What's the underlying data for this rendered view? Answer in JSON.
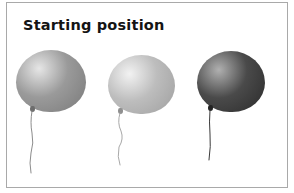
{
  "panel": {
    "title": "Starting position",
    "background_color": "#ffffff",
    "border_color": "#a9a9a9"
  },
  "scene": {
    "description": "Three balloons in a row shown at their starting position",
    "object_count": 3,
    "balloons": [
      {
        "name": "balloon-left",
        "shade_label": "medium gray",
        "fill_color": "#9a9a9a",
        "highlight_color": "#e6e6e6",
        "edge_color": "#7e7e7e",
        "knot_color": "#6d6d6d",
        "string_color": "#8c8c8c",
        "left": 16,
        "top": 50,
        "width": 70,
        "height": 62,
        "highlight_x_pct": 33,
        "highlight_y_pct": 30,
        "knot_x": 30,
        "knot_y": 106,
        "string_height": 62,
        "string_path": "M 3 0 Q 1 12 3 22 Q 5 32 2 42 Q 0 52 2 62"
      },
      {
        "name": "balloon-center",
        "shade_label": "light gray",
        "fill_color": "#bdbdbd",
        "highlight_color": "#f2f2f2",
        "edge_color": "#a3a3a3",
        "knot_color": "#8f8f8f",
        "string_color": "#a8a8a8",
        "left": 108,
        "top": 55,
        "width": 67,
        "height": 59,
        "highlight_x_pct": 32,
        "highlight_y_pct": 32,
        "knot_x": 118,
        "knot_y": 108,
        "string_height": 52,
        "string_path": "M 3 0 Q 0 10 4 18 Q 7 26 2 34 Q 0 44 3 52"
      },
      {
        "name": "balloon-right",
        "shade_label": "dark charcoal",
        "fill_color": "#4a4a4a",
        "highlight_color": "#b0b0b0",
        "edge_color": "#2f2f2f",
        "knot_color": "#242424",
        "string_color": "#3a3a3a",
        "left": 197,
        "top": 51,
        "width": 68,
        "height": 61,
        "highlight_x_pct": 32,
        "highlight_y_pct": 31,
        "knot_x": 208,
        "knot_y": 105,
        "string_height": 50,
        "string_path": "M 3 0 Q 2 12 3 24 Q 4 36 2 50"
      }
    ]
  }
}
